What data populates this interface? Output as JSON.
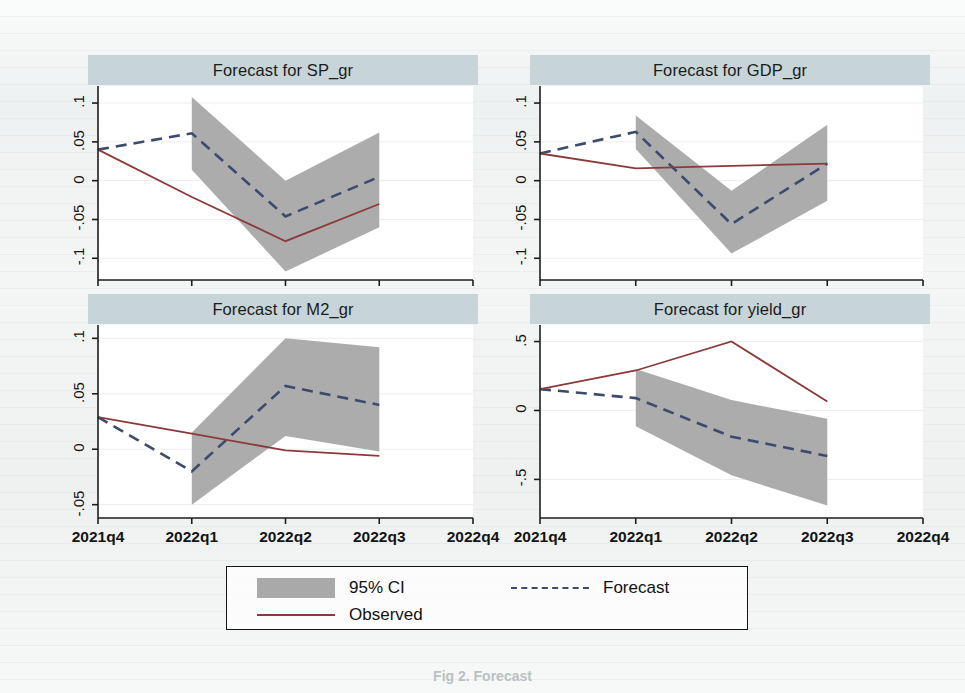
{
  "figure": {
    "caption": "Fig 2. Forecast",
    "legend": {
      "ci_label": "95% CI",
      "forecast_label": "Forecast",
      "observed_label": "Observed"
    },
    "colors": {
      "ci_band": "#a9a9a9",
      "forecast_line": "#3d4a6b",
      "observed_line": "#8b3a3a",
      "title_bar": "#c7d5d8",
      "plot_bg": "#ffffff",
      "page_bg": "#f2f4f3"
    }
  },
  "chart_data": [
    {
      "type": "line",
      "title": "Forecast for SP_gr",
      "xlabel": "",
      "ylabel": "",
      "x": [
        "2021q4",
        "2022q1",
        "2022q2",
        "2022q3"
      ],
      "xticks": [
        "2021q4",
        "2022q1",
        "2022q2",
        "2022q3",
        "2022q4"
      ],
      "yticks": [
        0.1,
        0.05,
        0,
        -0.05,
        -0.1
      ],
      "yticklabels": [
        ".1",
        ".05",
        "0",
        "-.05",
        "-.1"
      ],
      "ylim": [
        -0.128,
        0.122
      ],
      "grid": true,
      "legend_position": "below-figure",
      "series": [
        {
          "name": "Observed",
          "style": "solid",
          "color": "#8b3a3a",
          "values": [
            0.04,
            -0.021,
            -0.078,
            -0.03
          ]
        },
        {
          "name": "Forecast",
          "style": "dashed",
          "color": "#3d4a6b",
          "values": [
            0.04,
            0.061,
            -0.046,
            0.005
          ]
        },
        {
          "name": "95% CI upper",
          "style": "band",
          "values": [
            null,
            0.108,
            0.0,
            0.062
          ]
        },
        {
          "name": "95% CI lower",
          "style": "band",
          "values": [
            null,
            0.014,
            -0.117,
            -0.06
          ]
        }
      ]
    },
    {
      "type": "line",
      "title": "Forecast for GDP_gr",
      "xlabel": "",
      "ylabel": "",
      "x": [
        "2021q4",
        "2022q1",
        "2022q2",
        "2022q3"
      ],
      "xticks": [
        "2021q4",
        "2022q1",
        "2022q2",
        "2022q3",
        "2022q4"
      ],
      "yticks": [
        0.1,
        0.05,
        0,
        -0.05,
        -0.1
      ],
      "yticklabels": [
        ".1",
        ".05",
        "0",
        "-.05",
        "-.1"
      ],
      "ylim": [
        -0.128,
        0.122
      ],
      "grid": true,
      "legend_position": "below-figure",
      "series": [
        {
          "name": "Observed",
          "style": "solid",
          "color": "#8b3a3a",
          "values": [
            0.035,
            0.016,
            0.019,
            0.022
          ]
        },
        {
          "name": "Forecast",
          "style": "dashed",
          "color": "#3d4a6b",
          "values": [
            0.035,
            0.063,
            -0.056,
            0.022
          ]
        },
        {
          "name": "95% CI upper",
          "style": "band",
          "values": [
            null,
            0.084,
            -0.013,
            0.072
          ]
        },
        {
          "name": "95% CI lower",
          "style": "band",
          "values": [
            null,
            0.041,
            -0.094,
            -0.026
          ]
        }
      ]
    },
    {
      "type": "line",
      "title": "Forecast for M2_gr",
      "xlabel": "",
      "ylabel": "",
      "x": [
        "2021q4",
        "2022q1",
        "2022q2",
        "2022q3"
      ],
      "xticks": [
        "2021q4",
        "2022q1",
        "2022q2",
        "2022q3",
        "2022q4"
      ],
      "yticks": [
        0.1,
        0.05,
        0,
        -0.05
      ],
      "yticklabels": [
        ".1",
        ".05",
        "0",
        "-.05"
      ],
      "ylim": [
        -0.062,
        0.112
      ],
      "grid": true,
      "legend_position": "below-figure",
      "series": [
        {
          "name": "Observed",
          "style": "solid",
          "color": "#8b3a3a",
          "values": [
            0.029,
            0.014,
            -0.001,
            -0.006
          ]
        },
        {
          "name": "Forecast",
          "style": "dashed",
          "color": "#3d4a6b",
          "values": [
            0.029,
            -0.02,
            0.057,
            0.04
          ]
        },
        {
          "name": "95% CI upper",
          "style": "band",
          "values": [
            null,
            0.015,
            0.1,
            0.092
          ]
        },
        {
          "name": "95% CI lower",
          "style": "band",
          "values": [
            null,
            -0.05,
            0.012,
            -0.002
          ]
        }
      ]
    },
    {
      "type": "line",
      "title": "Forecast for yield_gr",
      "xlabel": "",
      "ylabel": "",
      "x": [
        "2021q4",
        "2022q1",
        "2022q2",
        "2022q3"
      ],
      "xticks": [
        "2021q4",
        "2022q1",
        "2022q2",
        "2022q3",
        "2022q4"
      ],
      "yticks": [
        0.5,
        0,
        -0.5
      ],
      "yticklabels": [
        ".5",
        "0",
        "-.5"
      ],
      "ylim": [
        -0.78,
        0.62
      ],
      "grid": true,
      "legend_position": "below-figure",
      "series": [
        {
          "name": "Observed",
          "style": "solid",
          "color": "#8b3a3a",
          "values": [
            0.155,
            0.29,
            0.5,
            0.065
          ]
        },
        {
          "name": "Forecast",
          "style": "dashed",
          "color": "#3d4a6b",
          "values": [
            0.155,
            0.09,
            -0.19,
            -0.33
          ]
        },
        {
          "name": "95% CI upper",
          "style": "band",
          "values": [
            null,
            0.3,
            0.075,
            -0.06
          ]
        },
        {
          "name": "95% CI lower",
          "style": "band",
          "values": [
            null,
            -0.115,
            -0.47,
            -0.69
          ]
        }
      ]
    }
  ]
}
